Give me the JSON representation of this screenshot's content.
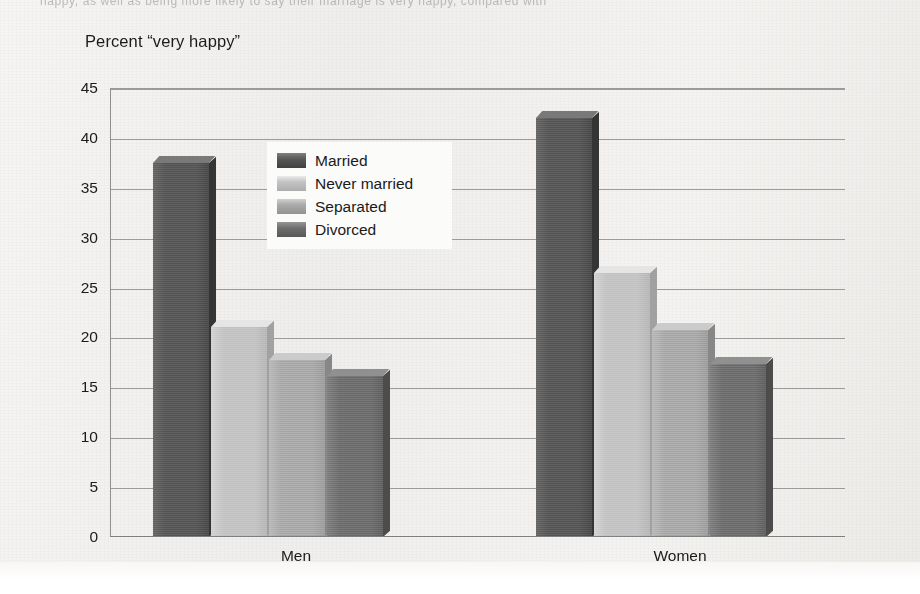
{
  "page": {
    "top_fragment": "happy, as well as being more likely to say their marriage is very happy, compared with",
    "background_color": "#f2f1ef"
  },
  "chart_data": {
    "type": "bar",
    "title": "",
    "axis_title": "Percent “very happy”",
    "xlabel": "",
    "ylabel": "Percent “very happy”",
    "categories": [
      "Men",
      "Women"
    ],
    "series": [
      {
        "name": "Married",
        "values": [
          37.5,
          42.0
        ],
        "color": "#575757"
      },
      {
        "name": "Never married",
        "values": [
          21.0,
          26.5
        ],
        "color": "#c3c3c3"
      },
      {
        "name": "Separated",
        "values": [
          17.7,
          20.7
        ],
        "color": "#a9a9a9"
      },
      {
        "name": "Divorced",
        "values": [
          16.1,
          17.3
        ],
        "color": "#6e6e6e"
      }
    ],
    "ylim": [
      0,
      45
    ],
    "yticks": [
      45,
      40,
      35,
      30,
      25,
      20,
      15,
      10,
      5,
      0
    ],
    "ytick_labels": [
      "45",
      "40",
      "35",
      "30",
      "25",
      "20",
      "15",
      "10",
      "5",
      "0"
    ],
    "grid": true,
    "legend_position": "inside-upper-center",
    "legend_entries": [
      "Married",
      "Never married",
      "Separated",
      "Divorced"
    ],
    "style": "3d-bars-grayscale"
  }
}
